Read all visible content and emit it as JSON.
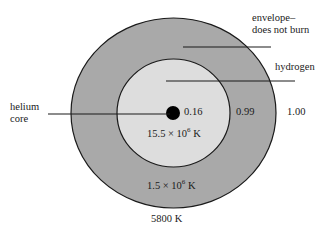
{
  "diagram": {
    "type": "stellar-structure-cross-section",
    "colors": {
      "envelope": "#a9a9a9",
      "hydrogen": "#dddddd",
      "core": "#000000",
      "outline": "#1a1a1a",
      "background": "#ffffff"
    },
    "labels": {
      "envelope_line1": "envelope–",
      "envelope_line2": "does not burn",
      "hydrogen": "hydrogen",
      "helium_line1": "helium",
      "helium_line2": "core",
      "radius_core": "0.16",
      "radius_hydrogen": "0.99",
      "radius_surface": "1.00",
      "temp_center_base": "15.5 × 10",
      "temp_center_exp": "6",
      "temp_center_unit": " K",
      "temp_mid_base": "1.5 × 10",
      "temp_mid_exp": "6",
      "temp_mid_unit": " K",
      "temp_surface": "5800 K"
    }
  }
}
